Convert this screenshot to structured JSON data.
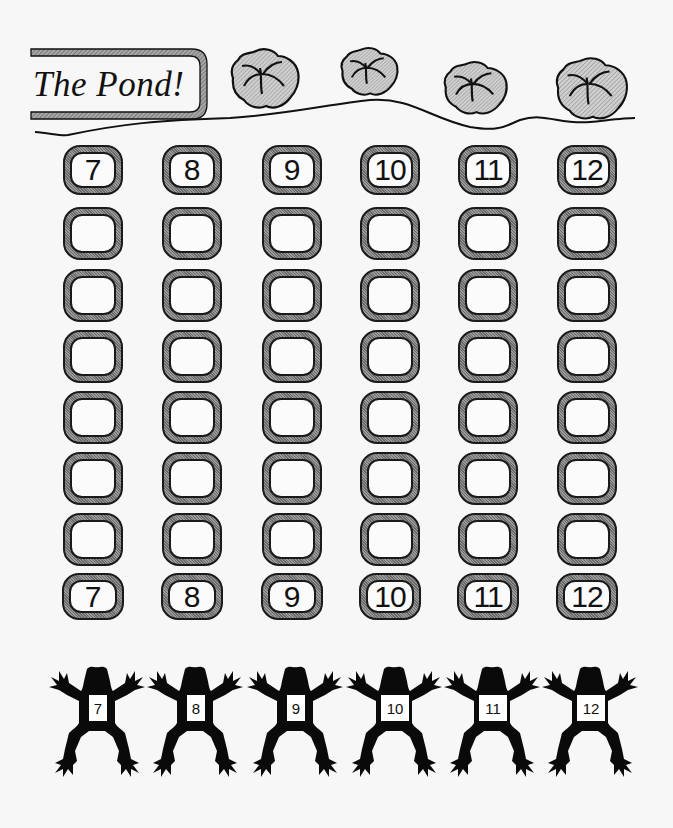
{
  "title": "The Pond!",
  "lily_pads": [
    {
      "id": 1,
      "x": 230,
      "y": 48,
      "w": 70,
      "h": 60
    },
    {
      "id": 2,
      "x": 340,
      "y": 47,
      "w": 58,
      "h": 49
    },
    {
      "id": 3,
      "x": 443,
      "y": 61,
      "w": 65,
      "h": 54
    },
    {
      "id": 4,
      "x": 555,
      "y": 57,
      "w": 73,
      "h": 63
    }
  ],
  "columns": [
    {
      "number": "7",
      "x": 63
    },
    {
      "number": "8",
      "x": 162
    },
    {
      "number": "9",
      "x": 262
    },
    {
      "number": "10",
      "x": 360
    },
    {
      "number": "11",
      "x": 458
    },
    {
      "number": "12",
      "x": 557
    }
  ],
  "rows_y": [
    145,
    207,
    269,
    330,
    391,
    452,
    513,
    573
  ],
  "track_top_labels": [
    "7",
    "8",
    "9",
    "10",
    "11",
    "12"
  ],
  "track_bottom_labels": [
    "7",
    "8",
    "9",
    "10",
    "11",
    "12"
  ],
  "frogs": [
    {
      "number": "7",
      "cx": 97
    },
    {
      "number": "8",
      "cx": 195
    },
    {
      "number": "9",
      "cx": 295
    },
    {
      "number": "10",
      "cx": 394
    },
    {
      "number": "11",
      "cx": 492
    },
    {
      "number": "12",
      "cx": 590
    }
  ],
  "colors": {
    "ink": "#111111",
    "hatch_dark": "#6a6a6a",
    "hatch_light": "#9a9a9a",
    "paper": "#f7f7f7"
  }
}
